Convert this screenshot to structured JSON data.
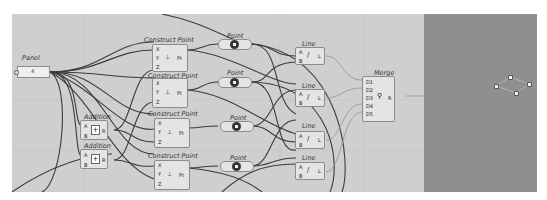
{
  "app": "Grasshopper",
  "canvas": {
    "background": "#cfcfcf",
    "panel": {
      "title": "Panel",
      "value": "4"
    },
    "construct_points": [
      {
        "title": "Construct Point",
        "inputs": [
          "X",
          "Y",
          "Z"
        ],
        "output": "Pt",
        "icon": "xyz-point-icon"
      },
      {
        "title": "Construct Point",
        "inputs": [
          "X",
          "Y",
          "Z"
        ],
        "output": "Pt",
        "icon": "xyz-point-icon"
      },
      {
        "title": "Construct Point",
        "inputs": [
          "X",
          "Y",
          "Z"
        ],
        "output": "Pt",
        "icon": "xyz-point-icon"
      },
      {
        "title": "Construct Point",
        "inputs": [
          "X",
          "Y",
          "Z"
        ],
        "output": "Pt",
        "icon": "xyz-point-icon"
      }
    ],
    "points": [
      {
        "title": "Point"
      },
      {
        "title": "Point"
      },
      {
        "title": "Point"
      },
      {
        "title": "Point"
      }
    ],
    "additions": [
      {
        "title": "Addition",
        "inputs": [
          "A",
          "B"
        ],
        "output": "R",
        "icon": "+"
      },
      {
        "title": "Addition",
        "inputs": [
          "A",
          "B"
        ],
        "output": "R",
        "icon": "+"
      }
    ],
    "lines": [
      {
        "title": "Line",
        "inputs": [
          "A",
          "B"
        ],
        "output": "L",
        "icon": "/"
      },
      {
        "title": "Line",
        "inputs": [
          "A",
          "B"
        ],
        "output": "L",
        "icon": "/"
      },
      {
        "title": "Line",
        "inputs": [
          "A",
          "B"
        ],
        "output": "L",
        "icon": "/"
      },
      {
        "title": "Line",
        "inputs": [
          "A",
          "B"
        ],
        "output": "L",
        "icon": "/"
      }
    ],
    "merge": {
      "title": "Merge",
      "inputs": [
        "D1",
        "D2",
        "D3",
        "D4",
        "D5"
      ],
      "output": "R"
    }
  },
  "viewport": {
    "background": "#8f8f8f",
    "points_count": 4
  },
  "colors": {
    "wire": "#3c3c3c",
    "wire_light": "#9a9a9a",
    "component": "#e4e4e4",
    "border": "#8c8c8c"
  }
}
